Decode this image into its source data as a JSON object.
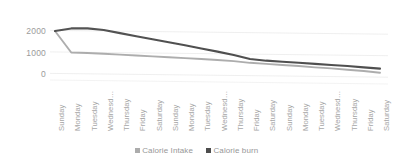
{
  "chart_data": {
    "type": "line",
    "title": "",
    "xlabel": "",
    "ylabel": "",
    "ylim": [
      0,
      2500
    ],
    "yticks": [
      0,
      1000,
      2000
    ],
    "ytick_labels": [
      "0",
      "1000",
      "2000"
    ],
    "grid": true,
    "legend_position": "bottom",
    "categories": [
      "Sunday",
      "Monday",
      "Tuesday",
      "Wednesd…",
      "Thursday",
      "Friday",
      "Saturday",
      "Sunday",
      "Monday",
      "Tuesday",
      "Wednesd…",
      "Thursday",
      "Friday",
      "Saturday",
      "Sunday",
      "Monday",
      "Tuesday",
      "Wednesd…",
      "Thursday",
      "Friday",
      "Saturday"
    ],
    "series": [
      {
        "name": "Calorie Intake",
        "color": "#a6a6a6",
        "values": [
          2000,
          1000,
          980,
          940,
          900,
          860,
          820,
          780,
          740,
          700,
          650,
          600,
          520,
          470,
          420,
          370,
          310,
          260,
          200,
          140,
          60
        ]
      },
      {
        "name": "Calorie burn",
        "color": "#404040",
        "values": [
          2000,
          2120,
          2120,
          2050,
          1900,
          1760,
          1620,
          1480,
          1340,
          1190,
          1040,
          880,
          700,
          620,
          570,
          520,
          470,
          420,
          370,
          310,
          250
        ]
      }
    ]
  },
  "legend": {
    "items": [
      {
        "label": "Calorie Intake",
        "color": "#a6a6a6",
        "marker": "square-marker"
      },
      {
        "label": "Calorie burn",
        "color": "#404040",
        "marker": "square-marker"
      }
    ]
  },
  "colors": {
    "intake": "#a6a6a6",
    "burn": "#404040",
    "grid": "#ededed",
    "tick_text": "#9a9a9a"
  }
}
